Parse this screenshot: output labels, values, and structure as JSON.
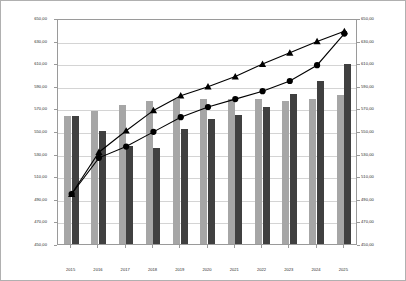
{
  "chart_data": {
    "type": "bar",
    "title": "",
    "xlabel": "",
    "ylabel": "Barwert und Eigenkapital in €",
    "ylim": [
      450,
      650
    ],
    "ytick_step": 20,
    "yticks": [
      "450,00",
      "470,00",
      "490,00",
      "510,00",
      "530,00",
      "550,00",
      "570,00",
      "590,00",
      "610,00",
      "630,00",
      "650,00"
    ],
    "secondary_axis": {
      "ylim": [
        450,
        650
      ],
      "yticks": [
        "450,00",
        "470,00",
        "490,00",
        "510,00",
        "530,00",
        "550,00",
        "570,00",
        "590,00",
        "610,00",
        "630,00",
        "650,00"
      ]
    },
    "grid": true,
    "legend_position": "top-center",
    "categories": [
      "2015",
      "2016",
      "2017",
      "2018",
      "2019",
      "2020",
      "2021",
      "2022",
      "2023",
      "2024",
      "2025"
    ],
    "series": [
      {
        "name": "Barwert +/- 0,00%",
        "type": "bar",
        "color": "#a6a6a6",
        "values": [
          563,
          568,
          573,
          577,
          578,
          578,
          578,
          578,
          577,
          578,
          582
        ]
      },
      {
        "name": "Barwert Szenario",
        "type": "bar",
        "color": "#404040",
        "values": [
          563,
          550,
          537,
          535,
          552,
          561,
          564,
          571,
          583,
          594,
          609
        ]
      },
      {
        "name": "Eigenkapital Szenario",
        "type": "line",
        "color": "#000000",
        "marker": "triangle",
        "values": [
          496,
          533,
          552,
          570,
          583,
          591,
          600,
          611,
          621,
          631,
          640
        ]
      },
      {
        "name": "Eigenkapital +/- 0,00%",
        "type": "line",
        "color": "#000000",
        "marker": "circle",
        "values": [
          496,
          528,
          538,
          551,
          564,
          573,
          580,
          587,
          596,
          610,
          638
        ]
      }
    ]
  },
  "legend": {
    "items": [
      {
        "label": "Barwert +/- 0,00%",
        "style": "swatch-light"
      },
      {
        "label": "Barwert Szenario",
        "style": "swatch-dark"
      },
      {
        "label": "Eigenkapital Szenario",
        "style": "line-triangle"
      },
      {
        "label": "Eigenkapital +/- 0,00%",
        "style": "line-circle"
      }
    ]
  }
}
